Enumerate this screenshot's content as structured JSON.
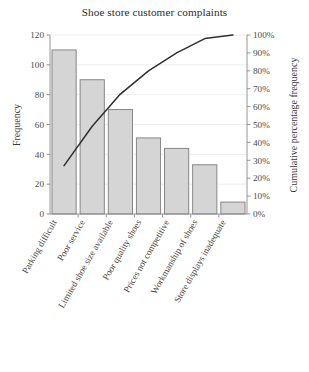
{
  "chart_data": {
    "type": "bar",
    "title": "Shoe store customer complaints",
    "xlabel": "",
    "ylabel": "Frequency",
    "y2label": "Cumulative percentage frequency",
    "ylim": [
      0,
      120
    ],
    "y2lim": [
      0,
      100
    ],
    "grid": true,
    "legend": "none",
    "categories": [
      "Parking difficult",
      "Poor service",
      "Limited shoe size available",
      "Poor quality shoes",
      "Prices not competitive",
      "Workmanship of shoes",
      "Store displays inadequate"
    ],
    "values": [
      110,
      90,
      70,
      51,
      44,
      33,
      8
    ],
    "series": [
      {
        "name": "Frequency",
        "type": "bar",
        "values": [
          110,
          90,
          70,
          51,
          44,
          33,
          8
        ]
      },
      {
        "name": "Cumulative percentage frequency",
        "type": "line",
        "values": [
          27,
          49,
          67,
          80,
          90,
          98,
          100
        ]
      }
    ],
    "yticks": [
      0,
      20,
      40,
      60,
      80,
      100,
      120
    ],
    "ytick_labels": [
      "0",
      "20",
      "40",
      "60",
      "80",
      "100",
      "120"
    ],
    "y2ticks": [
      0,
      10,
      20,
      30,
      40,
      50,
      60,
      70,
      80,
      90,
      100
    ],
    "y2tick_labels": [
      "0%",
      "10%",
      "20%",
      "30%",
      "40%",
      "50%",
      "60%",
      "70%",
      "80%",
      "90%",
      "100%"
    ],
    "bar_color": "#d5d5d5",
    "bar_edge_color": "#7d7d7d",
    "line_color": "#2f2f2f"
  }
}
